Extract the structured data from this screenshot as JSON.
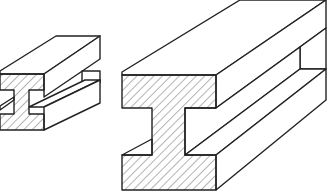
{
  "figure": {
    "colors": {
      "stroke": "#222222",
      "background": "#ffffff",
      "hatch": "#444444"
    },
    "objects": [
      {
        "id": "small-i-beam",
        "label": ""
      },
      {
        "id": "large-i-beam",
        "label": ""
      }
    ]
  }
}
